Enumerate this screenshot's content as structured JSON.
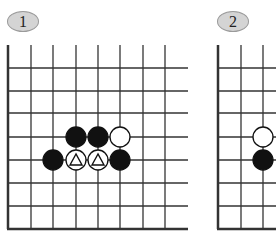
{
  "diagrams": [
    {
      "label": "1",
      "grid": {
        "vlines_x": [
          8,
          31,
          53,
          76,
          98,
          120,
          143,
          165
        ],
        "hlines_y": [
          68,
          91,
          113,
          137,
          160,
          183,
          206
        ],
        "left_edge_x": 8,
        "bottom_edge_y": 229,
        "top_y": 45,
        "right_x": 188
      },
      "stones": [
        {
          "color": "black",
          "x": 76,
          "y": 137,
          "mark": ""
        },
        {
          "color": "black",
          "x": 98,
          "y": 137,
          "mark": ""
        },
        {
          "color": "white",
          "x": 120,
          "y": 137,
          "mark": ""
        },
        {
          "color": "black",
          "x": 53,
          "y": 160,
          "mark": ""
        },
        {
          "color": "white",
          "x": 76,
          "y": 160,
          "mark": "triangle"
        },
        {
          "color": "white",
          "x": 98,
          "y": 160,
          "mark": "triangle"
        },
        {
          "color": "black",
          "x": 120,
          "y": 160,
          "mark": ""
        }
      ]
    },
    {
      "label": "2",
      "grid": {
        "vlines_x": [
          218,
          241,
          263
        ],
        "hlines_y": [
          68,
          91,
          113,
          137,
          160,
          183,
          206
        ],
        "left_edge_x": 218,
        "bottom_edge_y": 229,
        "top_y": 45,
        "right_x": 276
      },
      "stones": [
        {
          "color": "white",
          "x": 263,
          "y": 137,
          "mark": ""
        },
        {
          "color": "black",
          "x": 263,
          "y": 160,
          "mark": ""
        }
      ]
    }
  ],
  "colors": {
    "line": "#333333",
    "black_stone": "#111111",
    "white_stone": "#ffffff",
    "label_fill": "#d4d4d4"
  }
}
